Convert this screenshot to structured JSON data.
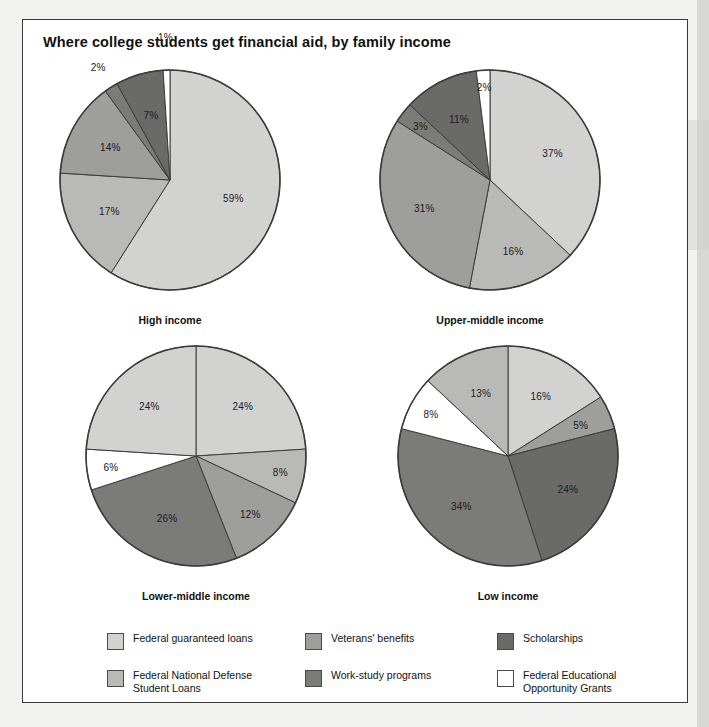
{
  "title": "Where college students get financial aid, by family income",
  "legend": {
    "columns": [
      [
        {
          "label": "Federal guaranteed loans",
          "label2": "",
          "color": "#d2d2d0",
          "name": "federal-guaranteed-loans"
        },
        {
          "label": "Federal National Defense",
          "label2": "Student Loans",
          "color": "#b9b9b7",
          "name": "federal-national-defense-student-loans"
        }
      ],
      [
        {
          "label": "Veterans' benefits",
          "label2": "",
          "color": "#9e9e9c",
          "name": "veterans-benefits"
        },
        {
          "label": "Work-study programs",
          "label2": "",
          "color": "#7b7b79",
          "name": "work-study-programs"
        }
      ],
      [
        {
          "label": "Scholarships",
          "label2": "",
          "color": "#6a6a68",
          "name": "scholarships"
        },
        {
          "label": "Federal Educational",
          "label2": "Opportunity Grants",
          "color": "#ffffff",
          "name": "federal-educational-opportunity-grants"
        }
      ]
    ]
  },
  "chart_data": {
    "type": "pie",
    "title": "Where college students get financial aid, by family income",
    "xlabel": "",
    "ylabel": "",
    "units": "percent",
    "legend_position": "bottom",
    "categories": [
      "Federal guaranteed loans",
      "Federal National Defense Student Loans",
      "Veterans' benefits",
      "Work-study programs",
      "Scholarships",
      "Federal Educational Opportunity Grants"
    ],
    "colors": [
      "#d2d2d0",
      "#b9b9b7",
      "#9e9e9c",
      "#7b7b79",
      "#6a6a68",
      "#ffffff"
    ],
    "charts": [
      {
        "name": "high-income",
        "caption": "High income",
        "slices": [
          {
            "category": "Federal guaranteed loans",
            "value": 59,
            "label": "59%",
            "color": "#d2d2d0"
          },
          {
            "category": "Federal National Defense Student Loans",
            "value": 17,
            "label": "17%",
            "color": "#b9b9b7"
          },
          {
            "category": "Veterans' benefits",
            "value": 14,
            "label": "14%",
            "color": "#9e9e9c"
          },
          {
            "category": "Work-study programs",
            "value": 2,
            "label": "2%",
            "color": "#7b7b79"
          },
          {
            "category": "Scholarships",
            "value": 7,
            "label": "7%",
            "color": "#6a6a68"
          },
          {
            "category": "Federal Educational Opportunity Grants",
            "value": 1,
            "label": "1%",
            "color": "#ffffff"
          }
        ]
      },
      {
        "name": "upper-middle-income",
        "caption": "Upper-middle income",
        "slices": [
          {
            "category": "Federal guaranteed loans",
            "value": 37,
            "label": "37%",
            "color": "#d2d2d0"
          },
          {
            "category": "Federal National Defense Student Loans",
            "value": 16,
            "label": "16%",
            "color": "#b9b9b7"
          },
          {
            "category": "Veterans' benefits",
            "value": 31,
            "label": "31%",
            "color": "#9e9e9c"
          },
          {
            "category": "Work-study programs",
            "value": 3,
            "label": "3%",
            "color": "#7b7b79"
          },
          {
            "category": "Scholarships",
            "value": 11,
            "label": "11%",
            "color": "#6a6a68"
          },
          {
            "category": "Federal Educational Opportunity Grants",
            "value": 2,
            "label": "2%",
            "color": "#ffffff"
          }
        ]
      },
      {
        "name": "lower-middle-income",
        "caption": "Lower-middle income",
        "slices": [
          {
            "category": "Federal guaranteed loans",
            "value": 24,
            "label": "24%",
            "color": "#d2d2d0"
          },
          {
            "category": "Federal National Defense Student Loans",
            "value": 8,
            "label": "8%",
            "color": "#b9b9b7"
          },
          {
            "category": "Veterans' benefits",
            "value": 12,
            "label": "12%",
            "color": "#9e9e9c"
          },
          {
            "category": "Work-study programs",
            "value": 26,
            "label": "26%",
            "color": "#7b7b79"
          },
          {
            "category": "Federal Educational Opportunity Grants",
            "value": 6,
            "label": "6%",
            "color": "#ffffff"
          },
          {
            "category": "Scholarships",
            "value": 24,
            "label": "24%",
            "color": "#d2d2d0"
          }
        ]
      },
      {
        "name": "low-income",
        "caption": "Low income",
        "slices": [
          {
            "category": "Federal guaranteed loans",
            "value": 16,
            "label": "16%",
            "color": "#d2d2d0"
          },
          {
            "category": "Veterans' benefits",
            "value": 5,
            "label": "5%",
            "color": "#9e9e9c"
          },
          {
            "category": "Scholarships",
            "value": 24,
            "label": "24%",
            "color": "#6a6a68"
          },
          {
            "category": "Work-study programs",
            "value": 34,
            "label": "34%",
            "color": "#7b7b79"
          },
          {
            "category": "Federal Educational Opportunity Grants",
            "value": 8,
            "label": "8%",
            "color": "#ffffff"
          },
          {
            "category": "Federal National Defense Student Loans",
            "value": 13,
            "label": "13%",
            "color": "#b9b9b7"
          }
        ]
      }
    ]
  }
}
